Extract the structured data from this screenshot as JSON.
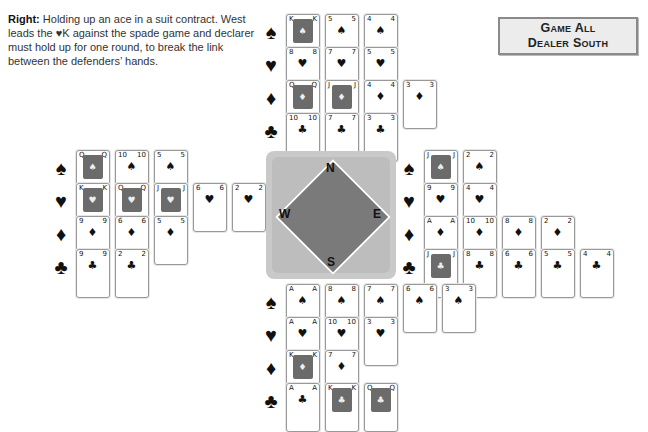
{
  "caption": {
    "lead": "Right:",
    "text": " Holding up an ace in a suit contract. West leads the ♥K against the spade game and declarer must hold up for one round, to break the link between the defenders’ hands."
  },
  "info_box": {
    "line1": "Game All",
    "line2": "Dealer South"
  },
  "compass": {
    "north": "N",
    "south": "S",
    "east": "E",
    "west": "W"
  },
  "suits": {
    "spades": "♠",
    "hearts": "♥",
    "diamonds": "♦",
    "clubs": "♣"
  },
  "hands": {
    "north": {
      "spades": [
        "K",
        "5",
        "4"
      ],
      "hearts": [
        "8",
        "7",
        "5"
      ],
      "diamonds": [
        "Q",
        "J",
        "4",
        "3"
      ],
      "clubs": [
        "10",
        "7",
        "3"
      ]
    },
    "west": {
      "spades": [
        "Q",
        "10",
        "5"
      ],
      "hearts": [
        "K",
        "Q",
        "J",
        "6",
        "2"
      ],
      "diamonds": [
        "9",
        "6",
        "5"
      ],
      "clubs": [
        "9",
        "2"
      ]
    },
    "east": {
      "spades": [
        "J",
        "2"
      ],
      "hearts": [
        "9",
        "4"
      ],
      "diamonds": [
        "A",
        "10",
        "8",
        "2"
      ],
      "clubs": [
        "J",
        "8",
        "6",
        "5",
        "4"
      ]
    },
    "south": {
      "spades": [
        "A",
        "8",
        "7",
        "6",
        "3"
      ],
      "hearts": [
        "A",
        "10",
        "3"
      ],
      "diamonds": [
        "K",
        "7"
      ],
      "clubs": [
        "A",
        "K",
        "Q"
      ]
    }
  }
}
